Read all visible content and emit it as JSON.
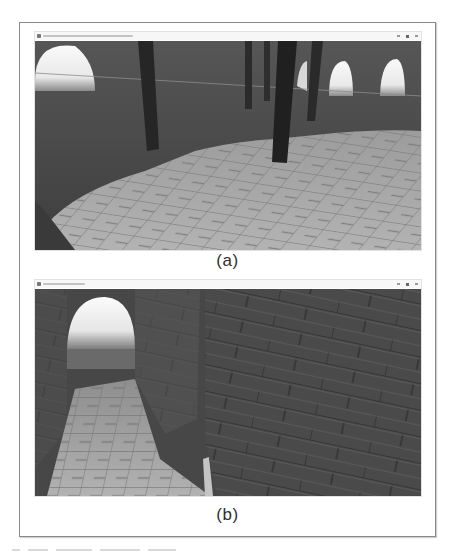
{
  "figure": {
    "panels": [
      {
        "id": "a",
        "caption": "(a)",
        "window": {
          "title_legible": false,
          "controls": [
            "minimize",
            "maximize",
            "close"
          ]
        },
        "scene": {
          "description": "3D render: circular stone hall with arched windows, dark cylindrical pillars, cobblestone floor",
          "elements": [
            "arched-window-left",
            "arched-window-right-1",
            "arched-window-right-2",
            "pillar",
            "pillar",
            "pillar",
            "pillar",
            "pillar",
            "cobblestone-floor",
            "stone-wall"
          ]
        }
      },
      {
        "id": "b",
        "caption": "(b)",
        "window": {
          "title_legible": false,
          "controls": [
            "minimize",
            "maximize",
            "close"
          ]
        },
        "scene": {
          "description": "3D render: narrow cobblestone corridor between brick walls with bright arched opening, large brick wall close-up on right",
          "elements": [
            "arched-opening",
            "corridor-floor",
            "brick-wall-left",
            "brick-pillar",
            "brick-wall-right"
          ]
        }
      }
    ]
  },
  "colors": {
    "frame_border": "#8a8a8a",
    "wall_dark": "#4a4a4a",
    "floor_light": "#a9a9a9",
    "pillar": "#262626",
    "sky_bright": "#f2f2f2",
    "caption_text": "#2f2f2f"
  }
}
